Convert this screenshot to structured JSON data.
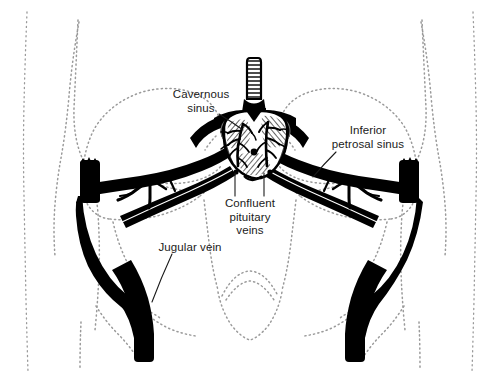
{
  "figure": {
    "type": "anatomical-line-diagram",
    "width": 499,
    "height": 391,
    "background_color": "#ffffff",
    "ink_color": "#000000",
    "dotted_outline_color": "#9a9a9a",
    "orientation": "coronal",
    "labels": [
      {
        "id": "cavernous-sinus",
        "line1": "Cavernous",
        "line2": "sinus",
        "line3": "",
        "x": 168,
        "y": 89,
        "leader_from": [
          222,
          117
        ],
        "leader_to": [
          243,
          131
        ]
      },
      {
        "id": "inferior-petrosal-sinus",
        "line1": "Inferior",
        "line2": "petrosal sinus",
        "line3": "",
        "x": 328,
        "y": 126,
        "leader_from": [
          332,
          154
        ],
        "leader_to": [
          312,
          178
        ]
      },
      {
        "id": "confluent-pituitary-veins",
        "line1": "Confluent",
        "line2": "pituitary",
        "line3": "veins",
        "x": 214,
        "y": 197,
        "leader_from": [
          234,
          195
        ],
        "leader_to": [
          234,
          172
        ],
        "leader_from_2": [
          262,
          195
        ],
        "leader_to_2": [
          262,
          172
        ]
      },
      {
        "id": "jugular-vein",
        "line1": "Jugular vein",
        "line2": "",
        "line3": "",
        "x": 153,
        "y": 241,
        "leader_from": [
          168,
          258
        ],
        "leader_to": [
          152,
          300
        ]
      }
    ],
    "structures": [
      {
        "id": "pituitary-gland",
        "name": "Pituitary gland",
        "fill": "#ffffff",
        "stroke": "#000000"
      },
      {
        "id": "pituitary-stalk",
        "name": "Infundibulum / pituitary stalk",
        "fill": "#ffffff",
        "stroke": "#000000"
      },
      {
        "id": "cavernous-sinus-left",
        "name": "Left cavernous sinus",
        "fill": "#000000"
      },
      {
        "id": "cavernous-sinus-right",
        "name": "Right cavernous sinus",
        "fill": "#000000"
      },
      {
        "id": "inferior-petrosal-sinus-left",
        "name": "Left inferior petrosal sinus",
        "fill": "#000000"
      },
      {
        "id": "inferior-petrosal-sinus-right",
        "name": "Right inferior petrosal sinus",
        "fill": "#000000"
      },
      {
        "id": "jugular-vein-left",
        "name": "Left internal jugular vein",
        "fill": "#000000"
      },
      {
        "id": "jugular-vein-right",
        "name": "Right internal jugular vein",
        "fill": "#000000"
      },
      {
        "id": "skull-outline",
        "name": "Skull and neck outline",
        "stroke": "#9a9a9a",
        "style": "dotted"
      }
    ]
  }
}
